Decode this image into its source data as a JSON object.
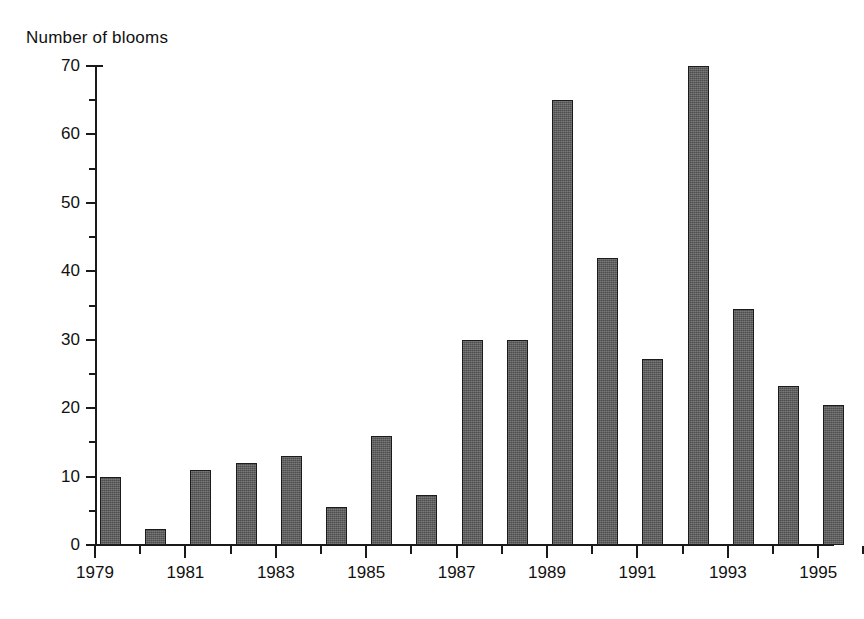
{
  "chart_data": {
    "type": "bar",
    "title": "Number of blooms",
    "xlabel": "",
    "ylabel": "Number of blooms",
    "ylim": [
      0,
      70
    ],
    "y_major_ticks": [
      0,
      10,
      20,
      30,
      40,
      50,
      60,
      70
    ],
    "y_minor_tick_step": 5,
    "grid": false,
    "legend": null,
    "categories": [
      "1979",
      "1980",
      "1981",
      "1982",
      "1983",
      "1984",
      "1985",
      "1986",
      "1987",
      "1988",
      "1989",
      "1990",
      "1991",
      "1992",
      "1993",
      "1994",
      "1995"
    ],
    "values": [
      10,
      2.3,
      11,
      12,
      13,
      5.5,
      16,
      7.3,
      30,
      30,
      65,
      42,
      27.2,
      70,
      34.5,
      23.3,
      20.4
    ],
    "x_tick_labels": [
      "1979",
      "1981",
      "1983",
      "1985",
      "1987",
      "1989",
      "1991",
      "1993",
      "1995"
    ],
    "bar_color": "#5e5e5e",
    "bar_edge_color": "#1b1b1b",
    "axis_color": "#1a1a1a",
    "background_color": "#ffffff"
  },
  "figure": {
    "title": "Number of blooms"
  }
}
